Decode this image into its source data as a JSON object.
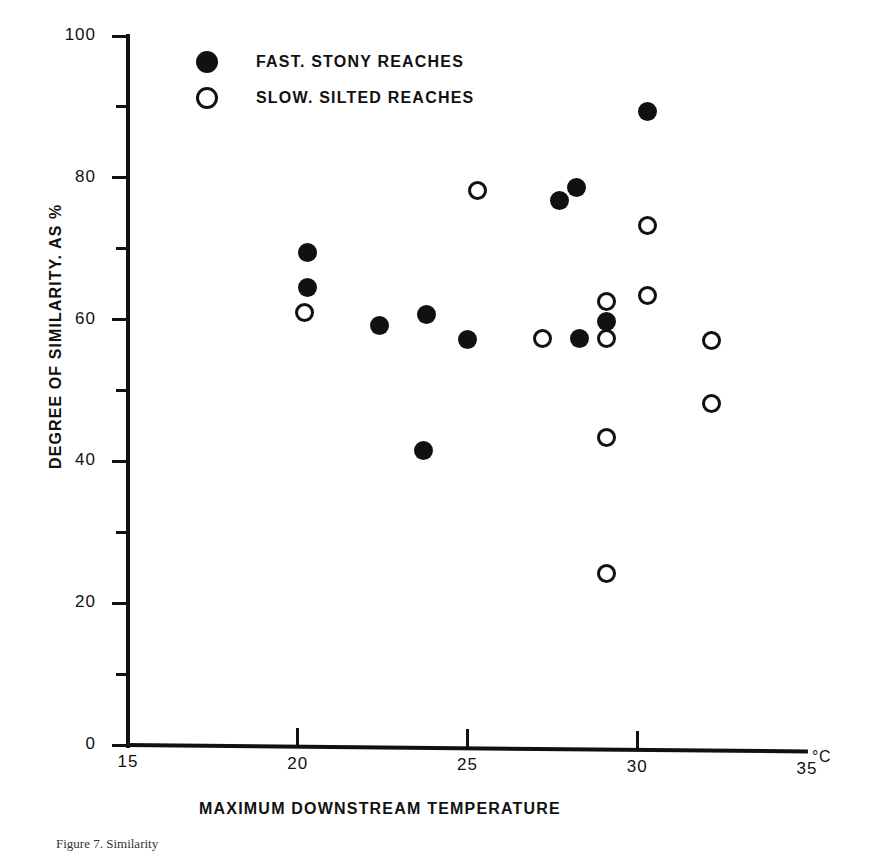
{
  "figure": {
    "caption": "Figure 7.  Similarity",
    "x_unit": "°C"
  },
  "legend": {
    "items": [
      {
        "marker": "filled-circle",
        "label": "FAST. STONY REACHES"
      },
      {
        "marker": "open-circle",
        "label": "SLOW. SILTED REACHES"
      }
    ]
  },
  "chart_data": {
    "type": "scatter",
    "title": "",
    "xlabel": "MAXIMUM DOWNSTREAM TEMPERATURE",
    "ylabel": "DEGREE OF SIMILARITY. AS %",
    "xlim": [
      15,
      35
    ],
    "ylim": [
      0,
      100
    ],
    "xticks": [
      15,
      20,
      25,
      30,
      35
    ],
    "yticks": [
      0,
      20,
      40,
      60,
      80,
      100
    ],
    "y_minor_ticks": [
      10,
      30,
      50,
      70,
      90
    ],
    "grid": false,
    "legend_position": "top-left",
    "x_unit": "°C",
    "series": [
      {
        "name": "FAST. STONY REACHES",
        "marker": "filled-circle",
        "points": [
          {
            "x": 20.3,
            "y": 69.5
          },
          {
            "x": 20.3,
            "y": 64.5
          },
          {
            "x": 22.4,
            "y": 59.2
          },
          {
            "x": 23.8,
            "y": 60.7
          },
          {
            "x": 23.7,
            "y": 41.5
          },
          {
            "x": 25.0,
            "y": 57.2
          },
          {
            "x": 27.7,
            "y": 76.8
          },
          {
            "x": 28.2,
            "y": 78.6
          },
          {
            "x": 28.3,
            "y": 57.4
          },
          {
            "x": 29.1,
            "y": 59.8
          },
          {
            "x": 30.3,
            "y": 89.3
          }
        ]
      },
      {
        "name": "SLOW. SILTED REACHES",
        "marker": "open-circle",
        "points": [
          {
            "x": 20.2,
            "y": 61.0
          },
          {
            "x": 25.3,
            "y": 78.2
          },
          {
            "x": 27.2,
            "y": 57.3
          },
          {
            "x": 29.1,
            "y": 62.6
          },
          {
            "x": 29.1,
            "y": 57.4
          },
          {
            "x": 29.1,
            "y": 43.4
          },
          {
            "x": 29.1,
            "y": 24.2
          },
          {
            "x": 30.3,
            "y": 73.3
          },
          {
            "x": 30.3,
            "y": 63.4
          },
          {
            "x": 32.2,
            "y": 57.0
          },
          {
            "x": 32.2,
            "y": 48.1
          }
        ]
      }
    ]
  }
}
